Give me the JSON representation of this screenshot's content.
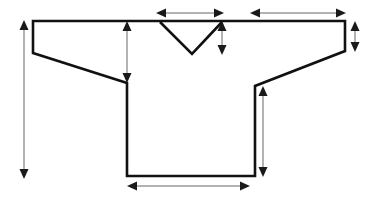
{
  "figure": {
    "background_color": "#ffffff",
    "outline_color": "#111111",
    "dimension_line_color": "#9a9a9a",
    "arrowhead_color": "#1a1a1a"
  },
  "garment": {
    "name": "jersey-outline",
    "outline_points": "33,21 345,21 345,51 255,86 255,176 127,176 127,83 33,53",
    "neck": {
      "name": "v-neck",
      "path": "M160,22 L192,54 L222,22"
    }
  },
  "dimensions": [
    {
      "id": "full-length",
      "label": "full length",
      "orientation": "vertical",
      "x1": 24,
      "y1": 22,
      "x2": 24,
      "y2": 178,
      "heads": "both"
    },
    {
      "id": "armhole-depth",
      "label": "armhole depth",
      "orientation": "vertical",
      "x1": 127,
      "y1": 22,
      "x2": 127,
      "y2": 82,
      "heads": "both"
    },
    {
      "id": "neck-width",
      "label": "neck width",
      "orientation": "horizontal",
      "x1": 157,
      "y1": 13,
      "x2": 223,
      "y2": 13,
      "heads": "both"
    },
    {
      "id": "neck-drop",
      "label": "neck drop",
      "orientation": "vertical",
      "x1": 222,
      "y1": 23,
      "x2": 222,
      "y2": 54,
      "heads": "both"
    },
    {
      "id": "sleeve-length",
      "label": "sleeve length",
      "orientation": "horizontal",
      "x1": 251,
      "y1": 13,
      "x2": 345,
      "y2": 13,
      "heads": "both"
    },
    {
      "id": "cuff-opening",
      "label": "cuff opening",
      "orientation": "vertical",
      "x1": 355,
      "y1": 23,
      "x2": 355,
      "y2": 50,
      "heads": "both"
    },
    {
      "id": "side-seam-length",
      "label": "side seam length",
      "orientation": "vertical",
      "x1": 263,
      "y1": 88,
      "x2": 263,
      "y2": 176,
      "heads": "both"
    },
    {
      "id": "hem-width",
      "label": "hem width",
      "orientation": "horizontal",
      "x1": 128,
      "y1": 186,
      "x2": 249,
      "y2": 186,
      "heads": "both"
    }
  ]
}
